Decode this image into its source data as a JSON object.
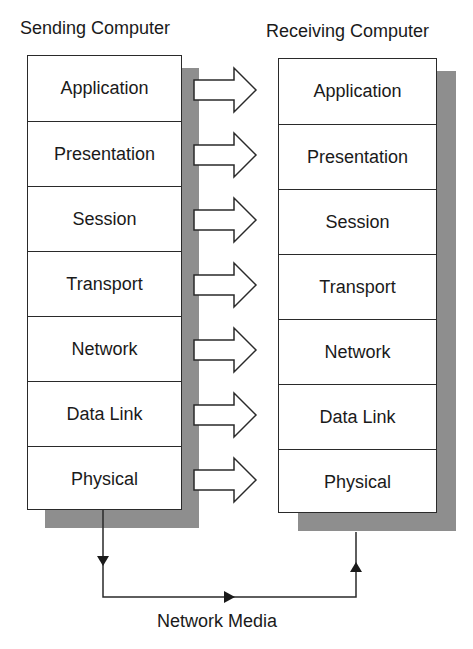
{
  "sending": {
    "title": "Sending Computer",
    "layers": [
      "Application",
      "Presentation",
      "Session",
      "Transport",
      "Network",
      "Data Link",
      "Physical"
    ]
  },
  "receiving": {
    "title": "Receiving Computer",
    "layers": [
      "Application",
      "Presentation",
      "Session",
      "Transport",
      "Network",
      "Data Link",
      "Physical"
    ]
  },
  "media": {
    "label": "Network Media"
  },
  "colors": {
    "shadow": "#8e8e8e",
    "line": "#2a2a2a",
    "background": "#ffffff"
  }
}
